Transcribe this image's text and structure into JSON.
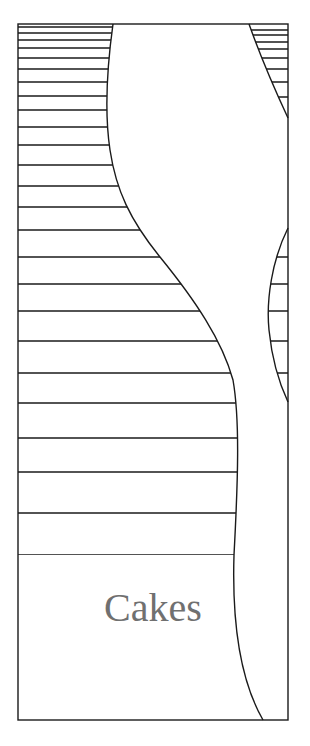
{
  "cover": {
    "title": "Cakes",
    "title_color": "#707070",
    "line_color": "#1a1a1a",
    "background": "#ffffff"
  },
  "frame": {
    "left": 18,
    "top": 24,
    "right": 288,
    "bottom": 720
  },
  "left_stripes_y": [
    27,
    33,
    40,
    48,
    58,
    69,
    82,
    96,
    110,
    127,
    145,
    165,
    186,
    207,
    230,
    257,
    284,
    311,
    341,
    373,
    403,
    438,
    472,
    513,
    555
  ],
  "right_top_stripes_y": [
    30,
    35,
    42,
    49,
    58,
    69,
    82,
    97
  ],
  "right_lens_stripes_y": [
    257,
    284,
    311,
    341,
    373
  ]
}
